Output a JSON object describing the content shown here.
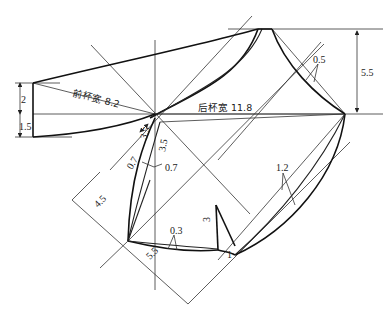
{
  "diagram": {
    "type": "pattern-drafting",
    "labels": {
      "front_cup_width": "前杯宽 8.2",
      "back_cup_width": "后杯宽  11.8",
      "dim_left_upper": "2",
      "dim_left_lower": "1.5",
      "dim_right": "5.5",
      "dim_top_right_offset": "0.5",
      "dim_center_a": "3.5",
      "dim_center_b": "3.5",
      "dim_left_07": "0.7",
      "dim_right_07": "0.7",
      "dim_45": "4.5",
      "dim_55": "5.5",
      "dim_03": "0.3",
      "dart_length": "3",
      "dart_offset": "1",
      "dim_12": "1.2"
    },
    "colors": {
      "line": "#222222",
      "background": "#ffffff"
    }
  }
}
